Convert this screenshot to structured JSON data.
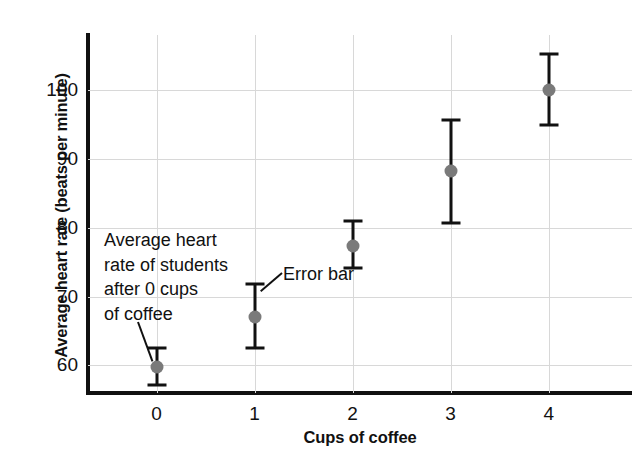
{
  "chart_data": {
    "type": "scatter",
    "title": "",
    "xlabel": "Cups of coffee",
    "ylabel": "Average heart rate (beats per minute)",
    "x": [
      0,
      1,
      2,
      3,
      4
    ],
    "values": [
      59.8,
      67.1,
      77.3,
      88.2,
      100.0
    ],
    "error_low": [
      57.2,
      62.5,
      74.2,
      80.7,
      95.0
    ],
    "error_high": [
      62.6,
      71.8,
      81.0,
      95.7,
      105.2
    ],
    "xticks": [
      "0",
      "1",
      "2",
      "3",
      "4"
    ],
    "yticks": [
      "60",
      "70",
      "80",
      "90",
      "100"
    ],
    "xlim": [
      -0.7,
      4.85
    ],
    "ylim": [
      56.0,
      108.0
    ],
    "grid": true,
    "legend": "none",
    "marker_color": "#7a7a7a",
    "errorbar_color": "#111111",
    "gridline_color": "#d8d8d8",
    "axis_color": "#111111",
    "annotations": [
      {
        "id": "point-explainer",
        "text": "Average heart\nrate of students\nafter 0 cups\nof coffee",
        "points_to_x": 0,
        "points_to_y": 59.8
      },
      {
        "id": "error-bar-label",
        "text": "Error bar",
        "points_to_x": 1,
        "points_to_y": 71.8
      }
    ]
  }
}
